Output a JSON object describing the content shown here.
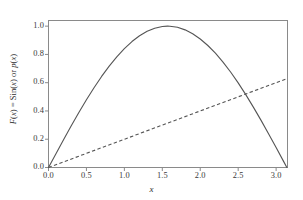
{
  "chart_data": {
    "type": "line",
    "title": "",
    "xlabel": "x",
    "ylabel": "F(x) = Sin(x) or p(x)",
    "ylabel_parts": [
      "F",
      "(",
      "x",
      ") = Sin(",
      "x",
      ") or ",
      "p",
      "(",
      "x",
      ")"
    ],
    "xlim": [
      0.0,
      3.15
    ],
    "ylim": [
      0.0,
      1.04
    ],
    "grid": false,
    "legend": "none",
    "frame": true,
    "tick_direction": "out",
    "xticks": [
      "0.0",
      "0.5",
      "1.0",
      "1.5",
      "2.0",
      "2.5",
      "3.0"
    ],
    "xtick_values": [
      0.0,
      0.5,
      1.0,
      1.5,
      2.0,
      2.5,
      3.0
    ],
    "yticks": [
      "0.0",
      "0.2",
      "0.4",
      "0.6",
      "0.8",
      "1.0"
    ],
    "ytick_values": [
      0.0,
      0.2,
      0.4,
      0.6,
      0.8,
      1.0
    ],
    "colors": {
      "curve": "#555555",
      "dashed": "#555555",
      "frame": "#8a8a8a",
      "text": "#3a3a3a",
      "background": "#ffffff"
    },
    "series": [
      {
        "name": "F(x) = Sin(x)",
        "style": "solid",
        "color": "#555555",
        "x": [
          0.0,
          0.1,
          0.2,
          0.3,
          0.4,
          0.5,
          0.6,
          0.7,
          0.8,
          0.9,
          1.0,
          1.1,
          1.2,
          1.3,
          1.4,
          1.5,
          1.5708,
          1.6,
          1.7,
          1.8,
          1.9,
          2.0,
          2.1,
          2.2,
          2.3,
          2.4,
          2.5,
          2.6,
          2.7,
          2.8,
          2.9,
          3.0,
          3.1,
          3.1416
        ],
        "values": [
          0.0,
          0.0998,
          0.1987,
          0.2955,
          0.3894,
          0.4794,
          0.5646,
          0.6442,
          0.7174,
          0.7833,
          0.8415,
          0.8912,
          0.932,
          0.9636,
          0.9854,
          0.9975,
          1.0,
          0.9996,
          0.9917,
          0.9738,
          0.9463,
          0.9093,
          0.8632,
          0.8085,
          0.7457,
          0.6755,
          0.5985,
          0.5155,
          0.4274,
          0.335,
          0.2392,
          0.1411,
          0.0416,
          0.0
        ]
      },
      {
        "name": "p(x)",
        "style": "dashed",
        "color": "#555555",
        "x": [
          0.0,
          3.1416
        ],
        "values": [
          0.0,
          0.6283
        ]
      }
    ]
  }
}
